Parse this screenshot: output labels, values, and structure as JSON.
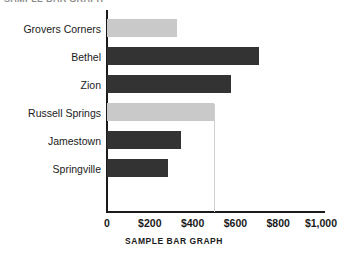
{
  "clipped_header_text": "SAMPLE BAR GRAPH",
  "caption": "SAMPLE BAR GRAPH",
  "colors": {
    "bar_light": "#c9c9c9",
    "bar_dark": "#333333",
    "axis": "#1a1a1a",
    "gridline": "#cfcfcf",
    "background": "#ffffff"
  },
  "axis": {
    "x_tick_labels": [
      "0",
      "$200",
      "$400",
      "$600",
      "$800",
      "$1,000"
    ],
    "x_tick_values": [
      0,
      200,
      400,
      600,
      800,
      1000
    ]
  },
  "chart_data": {
    "type": "bar",
    "orientation": "horizontal",
    "title": "SAMPLE BAR GRAPH",
    "xlabel": "",
    "ylabel": "",
    "categories": [
      "Grovers Corners",
      "Bethel",
      "Zion",
      "Russell Springs",
      "Jamestown",
      "Springville"
    ],
    "values": [
      325,
      710,
      580,
      500,
      345,
      285
    ],
    "value_tick_labels": [
      "0",
      "$200",
      "$400",
      "$600",
      "$800",
      "$1,000"
    ],
    "xlim": [
      0,
      1000
    ],
    "xticks": [
      0,
      200,
      400,
      600,
      800,
      1000
    ],
    "grid": false,
    "reference_line_value": 500,
    "legend": null,
    "bar_colors": [
      "#c9c9c9",
      "#333333",
      "#333333",
      "#c9c9c9",
      "#333333",
      "#333333"
    ]
  },
  "bar_labels": {
    "b0": "Grovers Corners",
    "b1": "Bethel",
    "b2": "Zion",
    "b3": "Russell Springs",
    "b4": "Jamestown",
    "b5": "Springville"
  },
  "ticks": {
    "t0": "0",
    "t1": "$200",
    "t2": "$400",
    "t3": "$600",
    "t4": "$800",
    "t5": "$1,000"
  }
}
